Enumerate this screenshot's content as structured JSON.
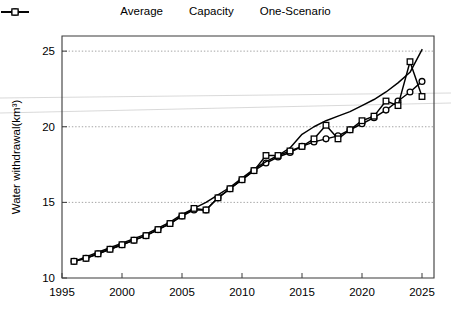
{
  "legend": {
    "position": "top-center",
    "items": [
      {
        "label": "Average",
        "marker": "circle-open-marker",
        "key_name": "legend-key-average"
      },
      {
        "label": "Capacity",
        "marker": "plain-line",
        "key_name": "legend-key-capacity"
      },
      {
        "label": "One-Scenario",
        "marker": "square-open-marker",
        "key_name": "legend-key-one-scenario"
      }
    ]
  },
  "chart_data": {
    "type": "line",
    "title": "",
    "xlabel": "",
    "ylabel": "Water withdrawal(km³)",
    "xlim": [
      1995,
      2026
    ],
    "ylim": [
      10,
      26
    ],
    "xticks": [
      1995,
      2000,
      2005,
      2010,
      2015,
      2020,
      2025
    ],
    "yticks": [
      10,
      15,
      20,
      25
    ],
    "grid": "horizontal-dotted-at-15-20-25",
    "x": [
      1996,
      1997,
      1998,
      1999,
      2000,
      2001,
      2002,
      2003,
      2004,
      2005,
      2006,
      2007,
      2008,
      2009,
      2010,
      2011,
      2012,
      2013,
      2014,
      2015,
      2016,
      2017,
      2018,
      2019,
      2020,
      2021,
      2022,
      2023,
      2024,
      2025
    ],
    "series": [
      {
        "name": "Average",
        "marker": "circle-open-marker",
        "values": [
          11.1,
          11.3,
          11.6,
          11.9,
          12.2,
          12.5,
          12.8,
          13.2,
          13.6,
          14.1,
          14.5,
          14.5,
          15.3,
          15.9,
          16.5,
          17.1,
          17.6,
          18.0,
          18.3,
          18.7,
          19.0,
          19.2,
          19.4,
          19.8,
          20.2,
          20.6,
          21.1,
          21.7,
          22.3,
          23.0
        ]
      },
      {
        "name": "Capacity",
        "marker": "plain-line",
        "values": [
          11.1,
          11.4,
          11.7,
          12.0,
          12.3,
          12.6,
          12.9,
          13.3,
          13.7,
          14.2,
          14.6,
          15.0,
          15.5,
          16.0,
          16.6,
          17.2,
          17.7,
          18.1,
          18.6,
          19.5,
          20.0,
          20.4,
          20.7,
          21.0,
          21.4,
          21.8,
          22.3,
          22.9,
          23.6,
          25.1
        ]
      },
      {
        "name": "One-Scenario",
        "marker": "square-open-marker",
        "values": [
          11.1,
          11.3,
          11.6,
          11.9,
          12.2,
          12.5,
          12.8,
          13.2,
          13.6,
          14.1,
          14.6,
          14.5,
          15.3,
          15.9,
          16.5,
          17.1,
          18.1,
          18.1,
          18.4,
          18.7,
          19.2,
          20.1,
          19.2,
          19.8,
          20.4,
          20.7,
          21.7,
          21.4,
          24.3,
          22.0
        ]
      }
    ]
  }
}
